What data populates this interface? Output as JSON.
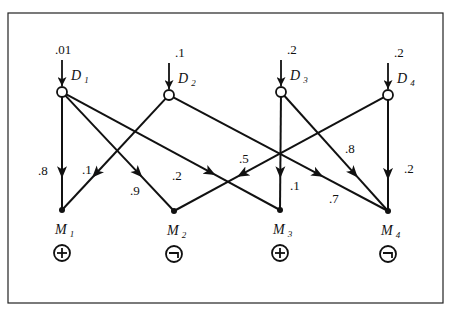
{
  "diagram": {
    "type": "bipartite-causal-network",
    "disorders": [
      {
        "id": "D1",
        "name": "D",
        "sub": "1",
        "prior": ".01",
        "x": 62,
        "y": 92
      },
      {
        "id": "D2",
        "name": "D",
        "sub": "2",
        "prior": ".1",
        "x": 169,
        "y": 95
      },
      {
        "id": "D3",
        "name": "D",
        "sub": "3",
        "prior": ".2",
        "x": 281,
        "y": 92
      },
      {
        "id": "D4",
        "name": "D",
        "sub": "4",
        "prior": ".2",
        "x": 388,
        "y": 95
      }
    ],
    "manifestations": [
      {
        "id": "M1",
        "name": "M",
        "sub": "1",
        "state": "+",
        "state_label": "present",
        "x": 62,
        "y": 210
      },
      {
        "id": "M2",
        "name": "M",
        "sub": "2",
        "state": "¬",
        "state_label": "absent",
        "x": 174,
        "y": 211
      },
      {
        "id": "M3",
        "name": "M",
        "sub": "3",
        "state": "+",
        "state_label": "present",
        "x": 280,
        "y": 210
      },
      {
        "id": "M4",
        "name": "M",
        "sub": "4",
        "state": "¬",
        "state_label": "absent",
        "x": 388,
        "y": 211
      }
    ],
    "edges": [
      {
        "from": "D1",
        "to": "M1",
        "weight": ".8",
        "lx": 38,
        "ly": 175
      },
      {
        "from": "D1",
        "to": "M2",
        "weight": ".9",
        "lx": 130,
        "ly": 195
      },
      {
        "from": "D1",
        "to": "M3",
        "weight": ".2",
        "lx": 172,
        "ly": 180
      },
      {
        "from": "D2",
        "to": "M1",
        "weight": ".1",
        "lx": 82,
        "ly": 174
      },
      {
        "from": "D2",
        "to": "M4",
        "weight": ".7",
        "lx": 329,
        "ly": 203
      },
      {
        "from": "D3",
        "to": "M3",
        "weight": ".1",
        "lx": 290,
        "ly": 190
      },
      {
        "from": "D3",
        "to": "M4",
        "weight": ".8",
        "lx": 345,
        "ly": 153
      },
      {
        "from": "D4",
        "to": "M2",
        "weight": ".5",
        "lx": 239,
        "ly": 163
      },
      {
        "from": "D4",
        "to": "M4",
        "weight": ".2",
        "lx": 404,
        "ly": 173
      }
    ],
    "frame": {
      "x": 8,
      "y": 13,
      "w": 435,
      "h": 290
    }
  }
}
